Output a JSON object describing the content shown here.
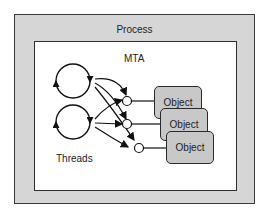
{
  "diagram": {
    "outer_box": {
      "label": "Process",
      "fill": "#d6d6d6"
    },
    "inner_box": {
      "label": "MTA",
      "fill": "#ffffff"
    },
    "threads_label": "Threads",
    "thread_count": 2,
    "objects": [
      {
        "label": "Object"
      },
      {
        "label": "Object"
      },
      {
        "label": "Object"
      }
    ],
    "object_fill": "#c8c8c8",
    "interfaces": 3
  }
}
